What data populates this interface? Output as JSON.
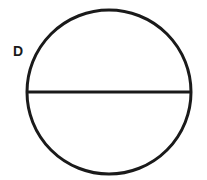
{
  "diagram": {
    "type": "circle-with-diameter",
    "label": "D",
    "stroke_color": "#1a1a1a",
    "background": "#ffffff",
    "circle": {
      "cx": 109,
      "cy": 92,
      "r": 82
    },
    "diameter": {
      "x1": 27,
      "y1": 92,
      "x2": 191,
      "y2": 92
    },
    "label_position": {
      "x": 13,
      "y": 56
    }
  }
}
